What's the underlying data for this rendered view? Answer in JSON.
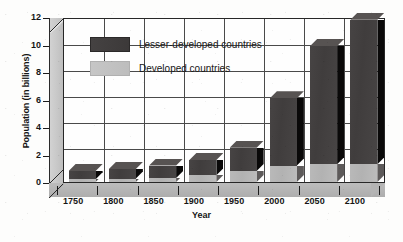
{
  "chart_data": {
    "type": "bar",
    "title": "",
    "subtitle": "",
    "xlabel": "Year",
    "ylabel": "Population (in billions)",
    "stacked": true,
    "three_d": true,
    "grid": true,
    "legend_position": "inside-upper-left",
    "categories": [
      "1750",
      "1800",
      "1850",
      "1900",
      "1950",
      "2000",
      "2050",
      "2100"
    ],
    "xlim": [
      "1750",
      "2100"
    ],
    "ylim": [
      0,
      12
    ],
    "yticks": [
      0,
      2,
      4,
      6,
      8,
      10,
      12
    ],
    "ytick_labels": [
      "0",
      "2",
      "4",
      "6",
      "8",
      "10",
      "12"
    ],
    "xtick_labels": [
      "1750",
      "1800",
      "1850",
      "1900",
      "1950",
      "2000",
      "2050",
      "2100"
    ],
    "series": [
      {
        "name": "Developed countries",
        "color": "#bababa",
        "values": [
          0.2,
          0.25,
          0.3,
          0.5,
          0.8,
          1.2,
          1.3,
          1.3
        ]
      },
      {
        "name": "Lesser-developed countries",
        "color": "#403d3d",
        "values": [
          0.6,
          0.7,
          0.9,
          1.1,
          1.7,
          4.9,
          8.6,
          10.5
        ]
      }
    ],
    "totals": [
      0.8,
      0.95,
      1.2,
      1.6,
      2.5,
      6.1,
      9.9,
      11.8
    ],
    "annotations": []
  },
  "legend": {
    "items": [
      {
        "label": "Lesser-developed countries",
        "swatch": "dark"
      },
      {
        "label": "Developed countries",
        "swatch": "light"
      }
    ]
  },
  "axes": {
    "y_title": "Population (in billions)",
    "x_title": "Year"
  },
  "colors": {
    "dark_series": "#403d3d",
    "light_series": "#bababa",
    "grid": "#4a4a4a",
    "axis": "#1b1b1b",
    "plot_bg": "#fefefe",
    "wall": "#c9c9c9",
    "floor": "#b4b4b4"
  }
}
